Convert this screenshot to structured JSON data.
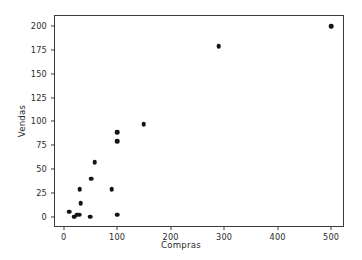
{
  "chart_data": {
    "type": "scatter",
    "title": "",
    "xlabel": "Compras",
    "ylabel": "Vendas",
    "xlim": [
      -18,
      524
    ],
    "ylim": [
      -11,
      212
    ],
    "grid": false,
    "legend": null,
    "xticks": [
      0,
      100,
      200,
      300,
      400,
      500
    ],
    "xtick_labels": [
      "0",
      "100",
      "200",
      "300",
      "400",
      "500"
    ],
    "yticks": [
      0,
      25,
      50,
      75,
      100,
      125,
      150,
      175,
      200
    ],
    "ytick_labels": [
      "0",
      "25",
      "50",
      "75",
      "100",
      "125",
      "150",
      "175",
      "200"
    ],
    "marker": "circle",
    "marker_color": "#141414",
    "points": [
      {
        "x": 10,
        "y": 5
      },
      {
        "x": 20,
        "y": 0
      },
      {
        "x": 25,
        "y": 2
      },
      {
        "x": 30,
        "y": 2
      },
      {
        "x": 30,
        "y": 29
      },
      {
        "x": 32,
        "y": 14
      },
      {
        "x": 50,
        "y": 0
      },
      {
        "x": 52,
        "y": 40
      },
      {
        "x": 58,
        "y": 57
      },
      {
        "x": 90,
        "y": 29
      },
      {
        "x": 100,
        "y": 2
      },
      {
        "x": 100,
        "y": 79
      },
      {
        "x": 100,
        "y": 89
      },
      {
        "x": 150,
        "y": 97
      },
      {
        "x": 290,
        "y": 179
      },
      {
        "x": 500,
        "y": 200
      }
    ]
  },
  "axes": {
    "frame_color": "#3a3a3a",
    "background": "#ffffff"
  }
}
